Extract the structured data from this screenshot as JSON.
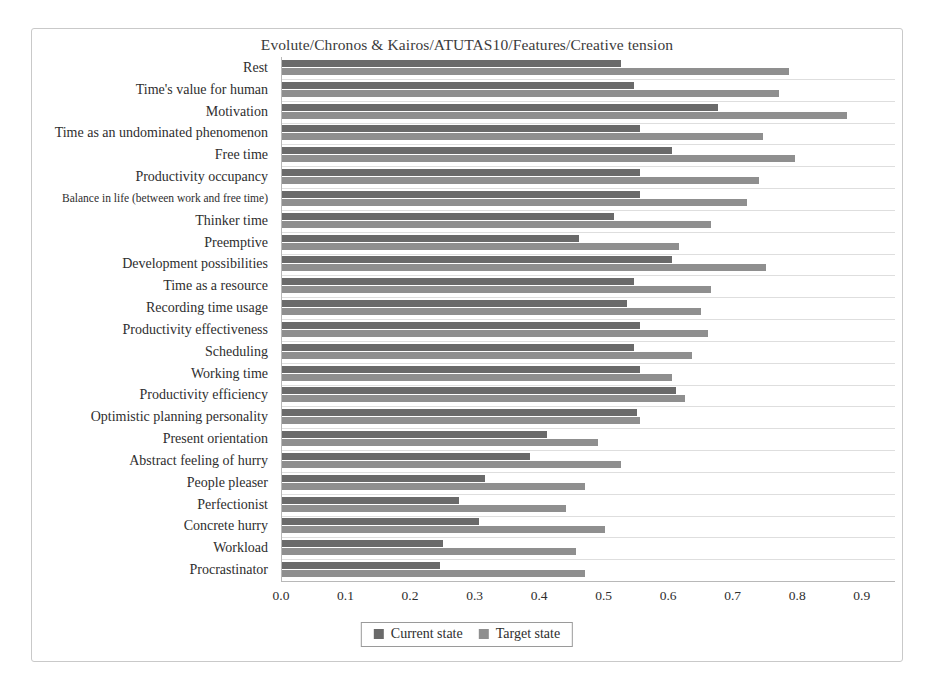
{
  "chart_data": {
    "type": "bar",
    "orientation": "horizontal",
    "title": "Evolute/Chronos & Kairos/ATUTAS10/Features/Creative tension",
    "xlabel": "",
    "ylabel": "",
    "xlim": [
      0.0,
      0.95
    ],
    "xticks": [
      "0.0",
      "0.1",
      "0.2",
      "0.3",
      "0.4",
      "0.5",
      "0.6",
      "0.7",
      "0.8",
      "0.9"
    ],
    "xtick_values": [
      0.0,
      0.1,
      0.2,
      0.3,
      0.4,
      0.5,
      0.6,
      0.7,
      0.8,
      0.9
    ],
    "grid": true,
    "grid_axis": "y",
    "legend_position": "bottom-center",
    "categories": [
      "Rest",
      "Time's value for human",
      "Motivation",
      "Time as an undominated phenomenon",
      "Free time",
      "Productivity occupancy",
      "Balance in life (between work and free time)",
      "Thinker time",
      "Preemptive",
      "Development possibilities",
      "Time as a resource",
      "Recording time usage",
      "Productivity effectiveness",
      "Scheduling",
      "Working time",
      "Productivity efficiency",
      "Optimistic planning personality",
      "Present orientation",
      "Abstract feeling of hurry",
      "People pleaser",
      "Perfectionist",
      "Concrete hurry",
      "Workload",
      "Procrastinator"
    ],
    "series": [
      {
        "name": "Current state",
        "color": "#6a6a6a",
        "values": [
          0.525,
          0.545,
          0.675,
          0.555,
          0.605,
          0.555,
          0.555,
          0.515,
          0.46,
          0.605,
          0.545,
          0.535,
          0.555,
          0.545,
          0.555,
          0.61,
          0.55,
          0.41,
          0.385,
          0.315,
          0.275,
          0.305,
          0.25,
          0.245
        ]
      },
      {
        "name": "Target state",
        "color": "#8f8f8f",
        "values": [
          0.785,
          0.77,
          0.875,
          0.745,
          0.795,
          0.74,
          0.72,
          0.665,
          0.615,
          0.75,
          0.665,
          0.65,
          0.66,
          0.635,
          0.605,
          0.625,
          0.555,
          0.49,
          0.525,
          0.47,
          0.44,
          0.5,
          0.455,
          0.47
        ]
      }
    ]
  },
  "legend": {
    "entries": [
      {
        "label": "Current state"
      },
      {
        "label": "Target state"
      }
    ]
  }
}
